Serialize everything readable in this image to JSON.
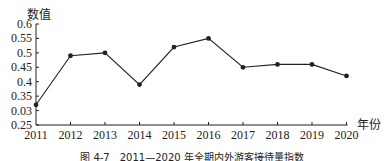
{
  "chart_data": {
    "type": "line",
    "title": "",
    "caption": "图 4-7　2011—2020 年全期内外游客接待量指数",
    "xlabel": "年份",
    "ylabel": "数值",
    "x": [
      "2011",
      "2012",
      "2013",
      "2014",
      "2015",
      "2016",
      "2017",
      "2018",
      "2019",
      "2020"
    ],
    "series": [
      {
        "name": "数值",
        "values": [
          0.32,
          0.49,
          0.5,
          0.39,
          0.52,
          0.55,
          0.45,
          0.46,
          0.46,
          0.42
        ],
        "color": "#222222",
        "marker": "circle"
      }
    ],
    "yticks": [
      "0.25",
      "0.03",
      "0.35",
      "0.4",
      "0.45",
      "0.5",
      "0.55",
      "0.6"
    ],
    "ylim": [
      0.25,
      0.6
    ],
    "grid": false,
    "legend": "none"
  }
}
